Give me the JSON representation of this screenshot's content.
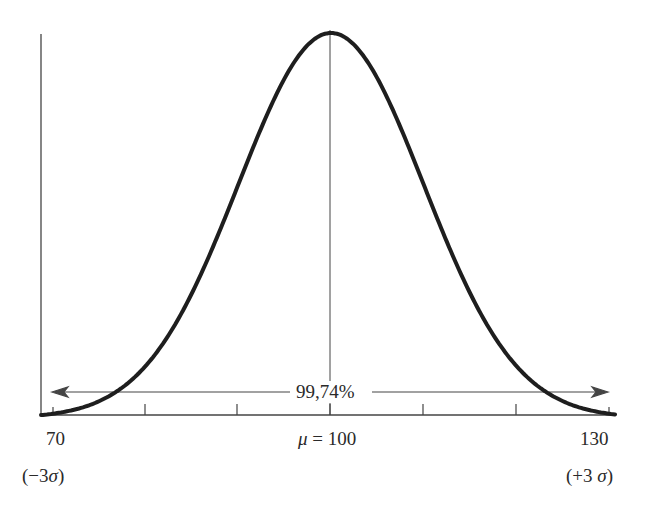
{
  "chart_data": {
    "type": "line",
    "title": "",
    "xlabel": "",
    "ylabel": "",
    "distribution": "normal",
    "mean": 100,
    "sigma": 10,
    "xlim": [
      70,
      130
    ],
    "x_ticks": [
      70,
      80,
      90,
      100,
      110,
      120,
      130
    ],
    "tick_labels": {
      "left": "70",
      "center_prefix": "μ",
      "center": "= 100",
      "right": "130"
    },
    "sigma_labels": {
      "left": "(−3σ)",
      "right": "(+3σ)"
    },
    "annotation": {
      "text": "99,74%",
      "span": [
        70,
        130
      ],
      "type": "double-arrow"
    },
    "grid": false,
    "legend": null
  },
  "labels": {
    "x_left": "70",
    "x_center_mu": "μ",
    "x_center_val": " = 100",
    "x_right": "130",
    "sigma_left_open": "(−3",
    "sigma_left_sym": "σ",
    "sigma_left_close": ")",
    "sigma_right_open": "(+3 ",
    "sigma_right_sym": "σ",
    "sigma_right_close": ")",
    "percentage": "99,74%"
  }
}
